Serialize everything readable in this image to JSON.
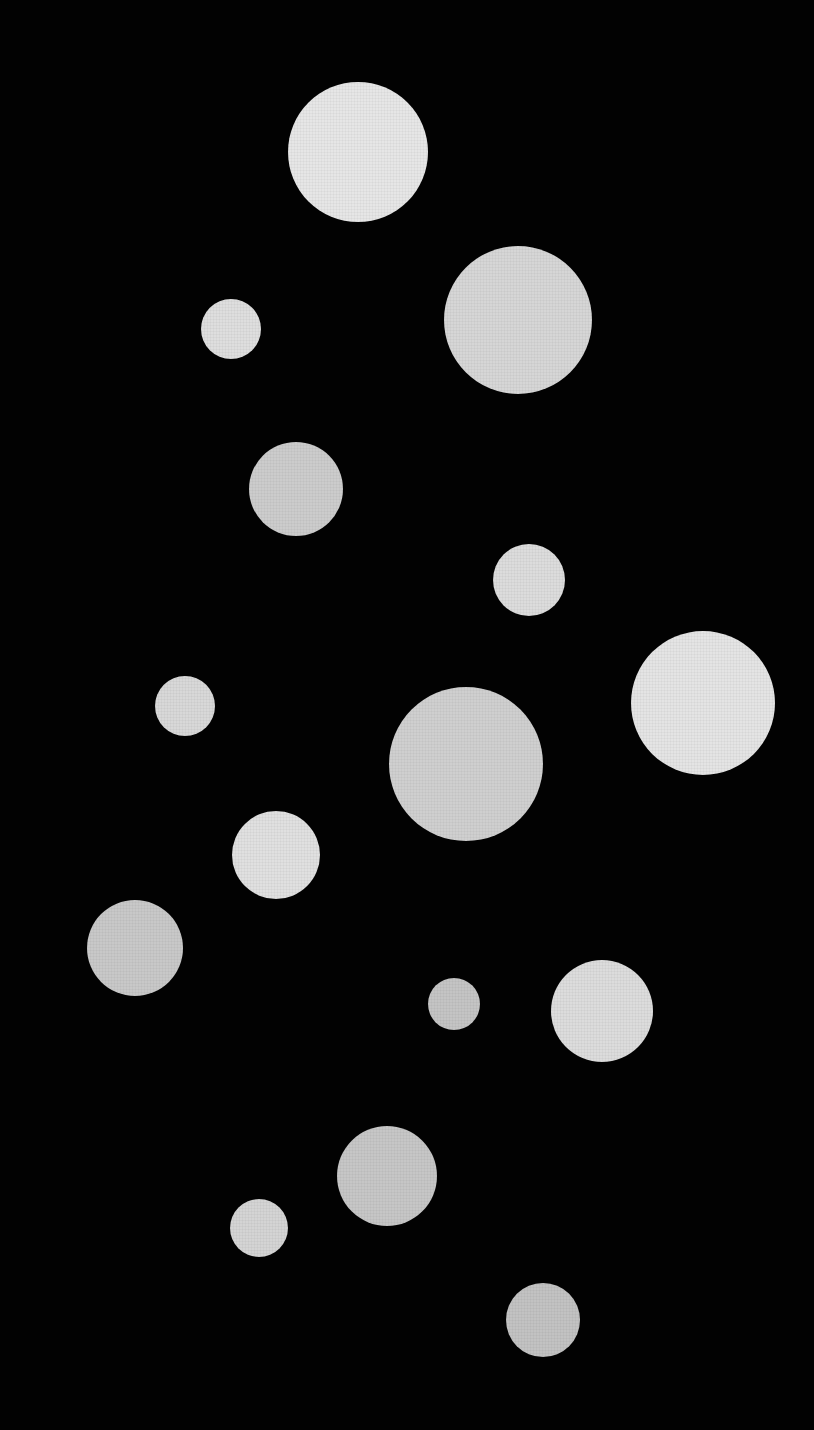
{
  "scene": {
    "description": "Photograph of felt/fabric circles of varying sizes arranged on a black background",
    "background": "#020202",
    "circles": [
      {
        "cx": 358,
        "cy": 152,
        "r": 70,
        "color": "#e6e6e6"
      },
      {
        "cx": 518,
        "cy": 320,
        "r": 74,
        "color": "#d6d6d6"
      },
      {
        "cx": 231,
        "cy": 329,
        "r": 30,
        "color": "#dedede"
      },
      {
        "cx": 296,
        "cy": 489,
        "r": 47,
        "color": "#cccccc"
      },
      {
        "cx": 529,
        "cy": 580,
        "r": 36,
        "color": "#dcdcdc"
      },
      {
        "cx": 703,
        "cy": 703,
        "r": 72,
        "color": "#e4e4e4"
      },
      {
        "cx": 185,
        "cy": 706,
        "r": 30,
        "color": "#d8d8d8"
      },
      {
        "cx": 466,
        "cy": 764,
        "r": 77,
        "color": "#cfcfcf"
      },
      {
        "cx": 276,
        "cy": 855,
        "r": 44,
        "color": "#e0e0e0"
      },
      {
        "cx": 135,
        "cy": 948,
        "r": 48,
        "color": "#c8c8c8"
      },
      {
        "cx": 454,
        "cy": 1004,
        "r": 26,
        "color": "#c4c4c4"
      },
      {
        "cx": 602,
        "cy": 1011,
        "r": 51,
        "color": "#dcdcdc"
      },
      {
        "cx": 387,
        "cy": 1176,
        "r": 50,
        "color": "#c6c6c6"
      },
      {
        "cx": 259,
        "cy": 1228,
        "r": 29,
        "color": "#d4d4d4"
      },
      {
        "cx": 543,
        "cy": 1320,
        "r": 37,
        "color": "#c2c2c2"
      }
    ]
  }
}
